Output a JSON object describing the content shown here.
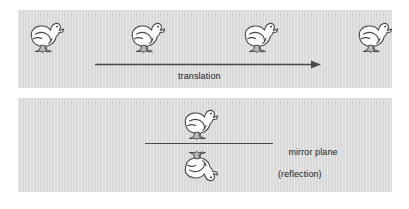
{
  "figure": {
    "name": "symmetry-operations-diagram",
    "background_color": "#ffffff",
    "panel_color": "#dcdcdc",
    "ink_color": "#4a4a4a",
    "text_color": "#1b1b1b"
  },
  "panels": [
    {
      "id": "translation",
      "operation": "translation",
      "label": "translation",
      "duck_count": 4,
      "ducks": [
        {
          "label": "duck-1",
          "x": 22,
          "y": 14,
          "orientation": "upright-facing-right"
        },
        {
          "label": "duck-2",
          "x": 123,
          "y": 14,
          "orientation": "upright-facing-right"
        },
        {
          "label": "duck-3",
          "x": 236,
          "y": 14,
          "orientation": "upright-facing-right"
        },
        {
          "label": "duck-4",
          "x": 350,
          "y": 14,
          "orientation": "upright-facing-right"
        }
      ],
      "arrow": {
        "label": "translation-arrow",
        "direction": "right",
        "x1": 95,
        "y1": 64,
        "x2": 321,
        "y2": 64
      }
    },
    {
      "id": "reflection",
      "operation": "reflection",
      "label_line1": "mirror plane",
      "label_line2": "(reflection)",
      "duck_count": 2,
      "ducks": [
        {
          "label": "duck-original",
          "x": 176,
          "y": 101,
          "orientation": "upright-facing-right"
        },
        {
          "label": "duck-reflected",
          "x": 176,
          "y": 146,
          "orientation": "flipped-vertically-facing-right"
        }
      ],
      "mirror_line": {
        "label": "mirror-plane-line",
        "x1": 145,
        "y1": 144,
        "x2": 273,
        "y2": 144
      }
    }
  ]
}
